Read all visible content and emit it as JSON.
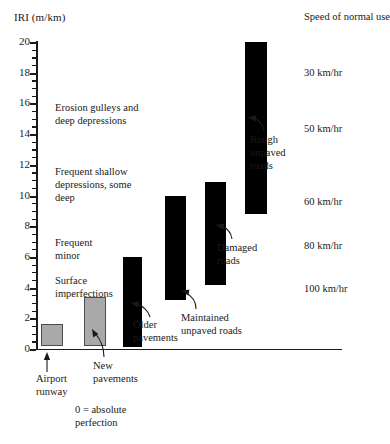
{
  "chart_data": {
    "type": "bar",
    "title": "",
    "ylabel": "IRI (m/km)",
    "xlabel": "",
    "ylim": [
      0,
      20
    ],
    "ytick_step": 2,
    "ytick_labels": [
      "0",
      "2",
      "4",
      "6",
      "8",
      "10",
      "12",
      "14",
      "16",
      "18",
      "20"
    ],
    "minor_ticks": true,
    "grid": false,
    "legend": false,
    "orientation": "vertical-range-bars",
    "categories": [
      "Airport runway",
      "New pavements",
      "Older pavements",
      "Maintained unpaved roads",
      "Damaged roads",
      "Rough unpaved roads"
    ],
    "bars": [
      {
        "label": "Airport runway",
        "low": 0.2,
        "high": 1.6,
        "color": "#a9a9a9"
      },
      {
        "label": "New pavements",
        "low": 0.2,
        "high": 3.4,
        "color": "#a9a9a9"
      },
      {
        "label": "Older pavements",
        "low": 0.1,
        "high": 6.0,
        "color": "#000000"
      },
      {
        "label": "Maintained unpaved roads",
        "low": 3.2,
        "high": 10.0,
        "color": "#000000"
      },
      {
        "label": "Damaged roads",
        "low": 4.2,
        "high": 10.9,
        "color": "#000000"
      },
      {
        "label": "Rough unpaved roads",
        "low": 8.8,
        "high": 20.0,
        "color": "#000000"
      }
    ],
    "left_annotations": [
      {
        "text": "Erosion gulleys and\ndeep depressions",
        "iri_range": [
          12.5,
          16.0
        ]
      },
      {
        "text": "Frequent shallow\ndepressions, some\ndeep",
        "iri_range": [
          9.0,
          12.0
        ]
      },
      {
        "text": "Frequent\nminor",
        "iri_range": [
          5.8,
          7.5
        ]
      },
      {
        "text": "Surface\nimperfections",
        "iri_range": [
          3.2,
          4.8
        ]
      }
    ],
    "speed_axis_title": "Speed of\nnormal use",
    "speed_labels": [
      {
        "text": "30 km/hr",
        "iri": 18.0
      },
      {
        "text": "50 km/hr",
        "iri": 14.3
      },
      {
        "text": "60 km/hr",
        "iri": 9.6
      },
      {
        "text": "80 km/hr",
        "iri": 6.7
      },
      {
        "text": "100 km/hr",
        "iri": 3.9
      }
    ],
    "footnote": "0 = absolute\nperfection",
    "colors": {
      "gray_bar": "#a9a9a9",
      "black_bar": "#000000",
      "axis": "#1a1a1a",
      "background": "#ffffff"
    }
  },
  "axis": {
    "y_title": "IRI (m/km)",
    "ticks": [
      "20",
      "18",
      "16",
      "14",
      "12",
      "10",
      "8",
      "6",
      "4",
      "2",
      "0"
    ]
  },
  "speed_panel": {
    "title": "Speed of\nnormal use",
    "items": [
      "30 km/hr",
      "50 km/hr",
      "60 km/hr",
      "80 km/hr",
      "100 km/hr"
    ]
  },
  "descriptions": {
    "erosion": "Erosion gulleys and\ndeep depressions",
    "frequent_shallow": "Frequent shallow\ndepressions, some\ndeep",
    "frequent_minor": "Frequent\nminor",
    "surface": "Surface\nimperfections"
  },
  "callouts": {
    "airport_runway": "Airport\nrunway",
    "new_pavements": "New\npavements",
    "older_pavements": "Older\npavements",
    "maintained_unpaved": "Maintained\nunpaved roads",
    "damaged_roads": "Damaged\nroads",
    "rough_unpaved": "Rough\nunpaved\nroads"
  },
  "footnote": {
    "text": "0 = absolute\nperfection"
  }
}
